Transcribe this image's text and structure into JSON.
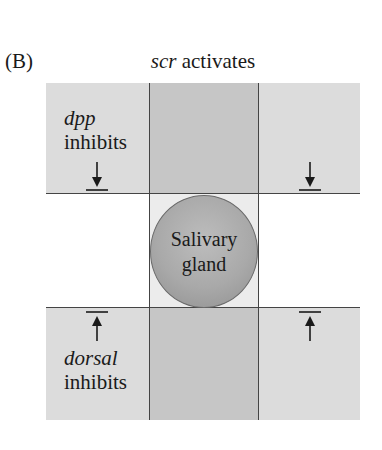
{
  "figure": {
    "panel_label": "(B)",
    "title": {
      "gene": "scr",
      "text": " activates"
    },
    "center": {
      "line1": "Salivary",
      "line2": "gland"
    },
    "top_region": {
      "gene": "dpp",
      "text": "inhibits"
    },
    "bottom_region": {
      "gene": "dorsal",
      "text": "inhibits"
    },
    "colors": {
      "band_fill": "#dcdcdc",
      "column_fill": "#c6c6c6",
      "center_cell_fill": "#ececec",
      "gland_fill": "#a9a9a9",
      "line": "#444444"
    },
    "arrows": [
      {
        "position": "top-left",
        "direction": "down",
        "symbol": "inhibition"
      },
      {
        "position": "top-right",
        "direction": "down",
        "symbol": "inhibition"
      },
      {
        "position": "bottom-left",
        "direction": "up",
        "symbol": "inhibition"
      },
      {
        "position": "bottom-right",
        "direction": "up",
        "symbol": "inhibition"
      }
    ]
  }
}
